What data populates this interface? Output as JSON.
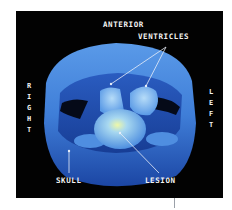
{
  "figure": {
    "labels": {
      "anterior": "ANTERIOR",
      "ventricles": "VENTRICLES",
      "right": "RIGHT",
      "left": "LEFT",
      "skull": "SKULL",
      "lesion": "LESION"
    },
    "colors": {
      "background": "#020202",
      "skull_light": "#6aa8f0",
      "skull_dark": "#1f4fae",
      "ventricle": "#8ec6f5",
      "lesion_highlight": "#e8f6a0",
      "label": "#f2f2f2"
    }
  }
}
